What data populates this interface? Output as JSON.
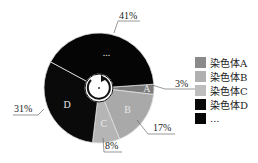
{
  "chart_data": {
    "type": "pie",
    "title": "",
    "categories": [
      "染色体A",
      "染色体B",
      "染色体C",
      "染色体D",
      "..."
    ],
    "values": [
      3,
      17,
      8,
      31,
      41
    ],
    "labels": [
      "3%",
      "17%",
      "8%",
      "31%",
      "41%"
    ],
    "slice_labels": [
      "A",
      "B",
      "C",
      "D",
      "..."
    ],
    "colors": [
      "#7a7a7a",
      "#a9a9a9",
      "#b5b5b5",
      "#0a0a0a",
      "#050505"
    ],
    "donut": true,
    "legend_position": "right"
  },
  "legend": {
    "items": [
      {
        "label": "染色体A",
        "color": "#8a8a8a"
      },
      {
        "label": "染色体B",
        "color": "#b0b0b0"
      },
      {
        "label": "染色体C",
        "color": "#bdbdbd"
      },
      {
        "label": "染色体D",
        "color": "#0a0a0a"
      },
      {
        "label": "...",
        "color": "#050505"
      }
    ]
  }
}
